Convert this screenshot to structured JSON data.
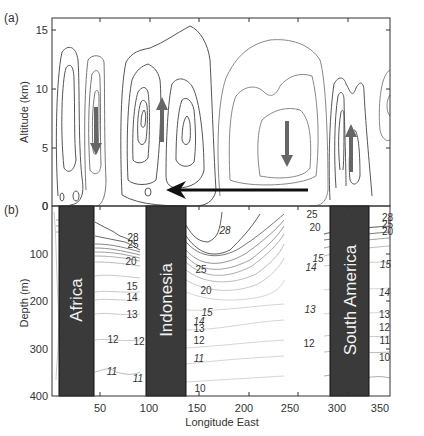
{
  "figure": {
    "panel_a": {
      "label": "(a)",
      "ylabel": "Altitude (km)",
      "yticks": [
        "0",
        "5",
        "10",
        "15"
      ],
      "ylim": [
        0,
        16
      ],
      "arrows": [
        {
          "direction": "down",
          "lon": 45
        },
        {
          "direction": "up",
          "lon": 117
        },
        {
          "direction": "down",
          "lon": 245
        },
        {
          "direction": "up",
          "lon": 300
        }
      ],
      "surface_arrow": {
        "direction": "west",
        "from_lon": 268,
        "to_lon": 120
      }
    },
    "panel_b": {
      "label": "(b)",
      "ylabel": "Depth (m)",
      "yticks": [
        "0",
        "100",
        "200",
        "300",
        "400"
      ],
      "ylim": [
        0,
        400
      ],
      "continents": [
        {
          "name": "Africa",
          "lon_start": 8,
          "lon_end": 43
        },
        {
          "name": "Indonesia",
          "lon_start": 95,
          "lon_end": 135
        },
        {
          "name": "South America",
          "lon_start": 282,
          "lon_end": 320
        }
      ],
      "contour_labels": [
        {
          "text": "28",
          "lon": 82,
          "depth": 64
        },
        {
          "text": "25",
          "lon": 82,
          "depth": 74
        },
        {
          "text": "20",
          "lon": 80,
          "depth": 118
        },
        {
          "text": "15",
          "lon": 78,
          "depth": 170
        },
        {
          "text": "14",
          "lon": 78,
          "depth": 186
        },
        {
          "text": "13",
          "lon": 78,
          "depth": 226
        },
        {
          "text": "12",
          "lon": 62,
          "depth": 284
        },
        {
          "text": "12",
          "lon": 84,
          "depth": 290
        },
        {
          "text": "11",
          "lon": 60,
          "depth": 356
        },
        {
          "text": "11",
          "lon": 85,
          "depth": 368
        },
        {
          "text": "28",
          "lon": 178,
          "depth": 48
        },
        {
          "text": "25",
          "lon": 143,
          "depth": 128
        },
        {
          "text": "20",
          "lon": 148,
          "depth": 170
        },
        {
          "text": "15",
          "lon": 150,
          "depth": 222
        },
        {
          "text": "14",
          "lon": 142,
          "depth": 240
        },
        {
          "text": "13",
          "lon": 142,
          "depth": 250
        },
        {
          "text": "12",
          "lon": 142,
          "depth": 280
        },
        {
          "text": "11",
          "lon": 142,
          "depth": 320
        },
        {
          "text": "10",
          "lon": 144,
          "depth": 380
        },
        {
          "text": "25",
          "lon": 258,
          "depth": 20
        },
        {
          "text": "20",
          "lon": 258,
          "depth": 40
        },
        {
          "text": "15",
          "lon": 262,
          "depth": 110
        },
        {
          "text": "14",
          "lon": 258,
          "depth": 128
        },
        {
          "text": "13",
          "lon": 255,
          "depth": 218
        },
        {
          "text": "12",
          "lon": 254,
          "depth": 290
        },
        {
          "text": "28",
          "lon": 340,
          "depth": 18
        },
        {
          "text": "25",
          "lon": 340,
          "depth": 32
        },
        {
          "text": "20",
          "lon": 340,
          "depth": 46
        },
        {
          "text": "15",
          "lon": 340,
          "depth": 124
        },
        {
          "text": "14",
          "lon": 340,
          "depth": 186
        },
        {
          "text": "13",
          "lon": 340,
          "depth": 226
        },
        {
          "text": "12",
          "lon": 340,
          "depth": 254
        },
        {
          "text": "11",
          "lon": 340,
          "depth": 280
        },
        {
          "text": "10",
          "lon": 340,
          "depth": 322
        }
      ]
    },
    "xaxis": {
      "label": "Longitude East",
      "ticks": [
        "50",
        "100",
        "150",
        "200",
        "250",
        "300",
        "350"
      ],
      "xlim": [
        0,
        360
      ]
    }
  }
}
